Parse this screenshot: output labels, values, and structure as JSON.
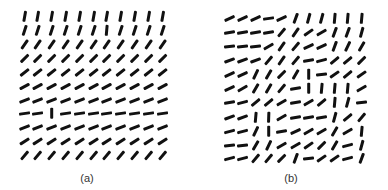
{
  "figure": {
    "panels": [
      {
        "id": "a",
        "label": "(a)",
        "label_pos": [
          87,
          172
        ],
        "segment_length": 11,
        "cols_x": [
          24,
          37.8,
          51.6,
          65.4,
          79.2,
          93,
          106.8,
          120.6,
          134.4,
          148.2,
          162
        ],
        "rows_y": [
          16,
          30,
          44,
          58,
          72,
          86,
          100,
          113,
          127,
          141,
          155
        ],
        "angles": [
          [
            80,
            80,
            80,
            80,
            80,
            80,
            80,
            80,
            80,
            80,
            80
          ],
          [
            72,
            72,
            72,
            72,
            72,
            72,
            85,
            72,
            72,
            72,
            72
          ],
          [
            55,
            55,
            55,
            55,
            55,
            55,
            55,
            55,
            55,
            55,
            55
          ],
          [
            45,
            45,
            45,
            45,
            45,
            45,
            45,
            45,
            45,
            45,
            45
          ],
          [
            38,
            38,
            38,
            38,
            38,
            38,
            38,
            38,
            38,
            38,
            38
          ],
          [
            28,
            28,
            28,
            28,
            28,
            28,
            28,
            28,
            28,
            28,
            28
          ],
          [
            22,
            22,
            22,
            22,
            22,
            22,
            22,
            22,
            22,
            22,
            22
          ],
          [
            8,
            8,
            90,
            8,
            8,
            8,
            8,
            8,
            8,
            8,
            8
          ],
          [
            22,
            22,
            22,
            22,
            22,
            22,
            22,
            22,
            22,
            22,
            22
          ],
          [
            32,
            32,
            32,
            32,
            32,
            32,
            32,
            32,
            32,
            32,
            32
          ],
          [
            50,
            50,
            50,
            50,
            50,
            50,
            50,
            50,
            50,
            50,
            50
          ]
        ]
      },
      {
        "id": "b",
        "label": "(b)",
        "label_pos": [
          291,
          172
        ],
        "segment_length": 11,
        "cols_x": [
          229,
          242.2,
          255.4,
          268.6,
          281.8,
          295,
          308.2,
          321.4,
          334.6,
          347.8,
          361
        ],
        "rows_y": [
          18,
          32,
          46,
          60,
          74,
          88,
          102,
          117,
          131,
          145,
          158
        ],
        "angles": [
          [
            25,
            25,
            25,
            8,
            25,
            70,
            75,
            75,
            85,
            85,
            85
          ],
          [
            10,
            10,
            10,
            10,
            50,
            55,
            35,
            30,
            70,
            70,
            75
          ],
          [
            5,
            5,
            5,
            30,
            55,
            50,
            25,
            25,
            70,
            65,
            60
          ],
          [
            20,
            20,
            20,
            50,
            55,
            50,
            10,
            15,
            40,
            40,
            45
          ],
          [
            25,
            25,
            65,
            60,
            45,
            60,
            90,
            5,
            35,
            40,
            35
          ],
          [
            25,
            30,
            60,
            60,
            50,
            10,
            90,
            85,
            85,
            85,
            30
          ],
          [
            10,
            15,
            40,
            40,
            30,
            10,
            30,
            40,
            85,
            75,
            5
          ],
          [
            20,
            20,
            85,
            88,
            30,
            10,
            10,
            10,
            75,
            40,
            50
          ],
          [
            15,
            15,
            65,
            90,
            10,
            25,
            30,
            30,
            60,
            30,
            85
          ],
          [
            5,
            5,
            60,
            65,
            30,
            30,
            35,
            45,
            60,
            15,
            75
          ],
          [
            15,
            15,
            50,
            50,
            45,
            70,
            5,
            35,
            35,
            15,
            70
          ]
        ]
      }
    ]
  }
}
